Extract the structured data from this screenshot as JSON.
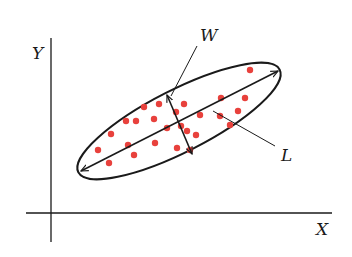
{
  "diagram": {
    "axes": {
      "x_label": "X",
      "y_label": "Y"
    },
    "annotations": {
      "width_label": "W",
      "length_label": "L"
    },
    "colors": {
      "stroke": "#1a1a1a",
      "dot": "#e8413c",
      "background": "#ffffff"
    },
    "points": [
      [
        98,
        150
      ],
      [
        111,
        134
      ],
      [
        109,
        163
      ],
      [
        126,
        121
      ],
      [
        128,
        145
      ],
      [
        134,
        155
      ],
      [
        136,
        121
      ],
      [
        154,
        119
      ],
      [
        155,
        143
      ],
      [
        144,
        107
      ],
      [
        159,
        104
      ],
      [
        167,
        128
      ],
      [
        176,
        112
      ],
      [
        184,
        104
      ],
      [
        181,
        126
      ],
      [
        200,
        115
      ],
      [
        196,
        135
      ],
      [
        187,
        131
      ],
      [
        190,
        150
      ],
      [
        177,
        148
      ],
      [
        221,
        98
      ],
      [
        220,
        116
      ],
      [
        245,
        98
      ],
      [
        238,
        111
      ],
      [
        230,
        125
      ],
      [
        250,
        70
      ]
    ]
  }
}
